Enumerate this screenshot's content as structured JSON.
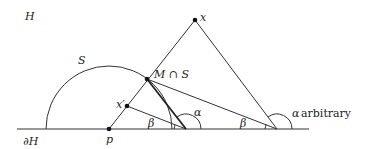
{
  "diagram": {
    "labels": {
      "halfplane": "H",
      "boundary": "∂H",
      "sphere": "S",
      "point_x": "x",
      "point_x_prime": "x′",
      "point_p": "p",
      "intersection": "M ∩ S",
      "alpha_inner": "α",
      "beta_left": "β",
      "beta_right": "β",
      "alpha_right_symbol": "α",
      "alpha_right_text": "arbitrary"
    },
    "points": {
      "x": [
        195,
        20
      ],
      "x_prime": [
        127,
        106
      ],
      "p": [
        109,
        129
      ],
      "M_cap_S": [
        147,
        79
      ],
      "inner_vertex": [
        186,
        129
      ],
      "outer_vertex": [
        277,
        129
      ]
    },
    "baseline": {
      "x1": 17,
      "x2": 309,
      "y": 129
    },
    "semicircle": {
      "cx": 109,
      "cy": 129,
      "r": 63
    },
    "colors": {
      "stroke": "#333333",
      "background": "#ffffff"
    }
  }
}
